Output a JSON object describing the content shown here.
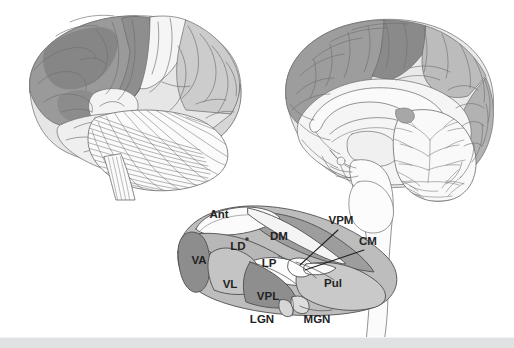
{
  "figure": {
    "background_color": "#ffffff",
    "line_color": "#5a5a5a",
    "label_color": "#232323",
    "footer_bar_color": "#e0e1e3"
  },
  "panels": {
    "lateral_brain": {
      "name": "Lateral view of cerebral hemisphere with cerebellum and brainstem",
      "regions": [
        {
          "name": "frontal-lobe",
          "shade": "#9a9a9a"
        },
        {
          "name": "frontal-lobe-dark-patch",
          "shade": "#838383"
        },
        {
          "name": "precentral-gyrus",
          "shade": "#8e8e8e"
        },
        {
          "name": "postcentral-gyrus",
          "shade": "#f4f4f4"
        },
        {
          "name": "parietal-lobe",
          "shade": "#cdcdcd"
        },
        {
          "name": "occipital-lobe",
          "shade": "#d8d8d8"
        },
        {
          "name": "temporal-lobe",
          "shade": "#efefef"
        },
        {
          "name": "insula-opercular-area",
          "shade": "#f7f7f7"
        },
        {
          "name": "cerebellum",
          "shade": "#fbfbfb"
        },
        {
          "name": "brainstem",
          "shade": "#fbfbfb"
        }
      ]
    },
    "midsagittal_brain": {
      "name": "Midsagittal view of brain showing corpus callosum, brainstem and cerebellum",
      "regions": [
        {
          "name": "medial-frontal-cortex",
          "shade": "#9d9d9d"
        },
        {
          "name": "paracentral-lobule",
          "shade": "#8b8b8b"
        },
        {
          "name": "medial-parietal-cortex",
          "shade": "#bdbdbd"
        },
        {
          "name": "cuneus-occipital-cortex",
          "shade": "#b4b4b4"
        },
        {
          "name": "corpus-callosum",
          "shade": "#f6f6f6"
        },
        {
          "name": "thalamus-medial",
          "shade": "#f2f2f2"
        },
        {
          "name": "brainstem-midbrain-pons-medulla",
          "shade": "#fafafa"
        },
        {
          "name": "cerebellum-arbor-vitae",
          "shade": "#f9f9f9"
        }
      ]
    },
    "thalamus_diagram": {
      "name": "Three-dimensional diagram of thalamic nuclei",
      "nuclei": [
        {
          "id": "ant",
          "label": "Ant",
          "full_name": "Anterior nucleus",
          "shade": "#fbfbfb",
          "label_x": 219,
          "label_y": 218
        },
        {
          "id": "dm",
          "label": "DM",
          "full_name": "Dorsomedial nucleus",
          "shade": "#9d9d9d",
          "label_x": 279,
          "label_y": 240
        },
        {
          "id": "ld",
          "label": "LD",
          "full_name": "Lateral dorsal nucleus",
          "shade": "#b7b7b7",
          "label_x": 238,
          "label_y": 250
        },
        {
          "id": "va",
          "label": "VA",
          "full_name": "Ventral anterior nucleus",
          "shade": "#8d8d8d",
          "label_x": 199,
          "label_y": 264
        },
        {
          "id": "lp",
          "label": "LP",
          "full_name": "Lateral posterior nucleus",
          "shade": "#fcfcfc",
          "label_x": 269,
          "label_y": 267
        },
        {
          "id": "vl",
          "label": "VL",
          "full_name": "Ventral lateral nucleus",
          "shade": "#c4c4c4",
          "label_x": 230,
          "label_y": 288
        },
        {
          "id": "vpl",
          "label": "VPL",
          "full_name": "Ventral posterolateral nucleus",
          "shade": "#8e8e8e",
          "label_x": 268,
          "label_y": 300
        },
        {
          "id": "pul",
          "label": "Pul",
          "full_name": "Pulvinar",
          "shade": "#c9c9c9",
          "label_x": 333,
          "label_y": 287
        },
        {
          "id": "vpm",
          "label": "VPM",
          "full_name": "Ventral posteromedial nucleus",
          "shade": "#fdfdfd",
          "label_x": 341,
          "label_y": 224
        },
        {
          "id": "cm",
          "label": "CM",
          "full_name": "Centromedian nucleus",
          "shade": "#fdfdfd",
          "label_x": 368,
          "label_y": 245
        },
        {
          "id": "lgn",
          "label": "LGN",
          "full_name": "Lateral geniculate nucleus",
          "shade": "#d6d6d6",
          "label_x": 262,
          "label_y": 323
        },
        {
          "id": "mgn",
          "label": "MGN",
          "full_name": "Medial geniculate nucleus",
          "shade": "#d6d6d6",
          "label_x": 317,
          "label_y": 323
        }
      ],
      "leader_lines": [
        {
          "name": "vpm-leader-line",
          "from_label": "VPM",
          "x1": 338,
          "y1": 230,
          "x2": 300,
          "y2": 264
        },
        {
          "name": "cm-leader-line",
          "from_label": "CM",
          "x1": 364,
          "y1": 250,
          "x2": 304,
          "y2": 270
        }
      ],
      "boundary_marker": {
        "name": "dm-ant-boundary-dot",
        "x": 247,
        "y": 239
      }
    }
  }
}
